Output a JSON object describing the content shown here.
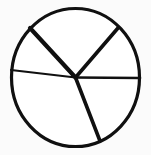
{
  "figure": {
    "name": "circle-divided-into-sectors",
    "background_color": "#fbfbfb",
    "stroke_color": "#101010",
    "fill_color": "#ffffff"
  },
  "chart_data": {
    "type": "pie",
    "title": "",
    "xlabel": "",
    "ylabel": "",
    "legend": "none",
    "grid": false,
    "labels_shown": false,
    "categories": [
      "sector-1",
      "sector-2",
      "sector-3",
      "sector-4",
      "sector-5"
    ],
    "values": [
      14,
      18,
      11,
      24,
      33
    ],
    "units": "percent",
    "circle": {
      "cx": 75.5,
      "cy": 77.5,
      "r": 65,
      "stroke_width": 3.2
    },
    "radii": [
      {
        "name": "radius-upper-left",
        "angle_deg": 141,
        "end_x": 30,
        "end_y": 28,
        "stroke_width": 4.2
      },
      {
        "name": "radius-upper-right",
        "angle_deg": 44,
        "end_x": 118,
        "end_y": 28,
        "stroke_width": 3.6
      },
      {
        "name": "radius-left-horizontal",
        "angle_deg": 173,
        "end_x": 11,
        "end_y": 70,
        "stroke_width": 2.2
      },
      {
        "name": "radius-right-horizontal",
        "angle_deg": 0,
        "end_x": 140,
        "end_y": 78,
        "stroke_width": 2.6
      },
      {
        "name": "radius-bottom",
        "angle_deg": 291,
        "end_x": 100,
        "end_y": 141,
        "stroke_width": 3.6
      }
    ]
  }
}
